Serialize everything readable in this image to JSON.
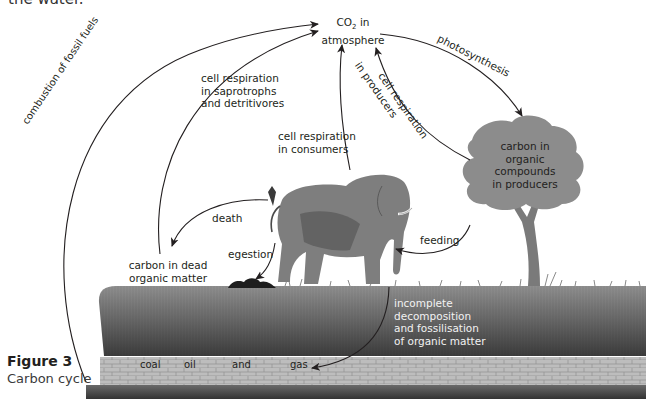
{
  "header": {
    "clipped_text": "the water."
  },
  "caption": {
    "figure": "Figure 3",
    "title": "Carbon cycle"
  },
  "nodes": {
    "atmosphere": {
      "line1": "CO",
      "sub": "2",
      "line1b": " in",
      "line2": "atmosphere"
    },
    "producers": [
      "carbon in",
      "organic",
      "compounds",
      "in producers"
    ],
    "dead_matter": [
      "carbon in dead",
      "organic matter"
    ]
  },
  "processes": {
    "combustion": "combustion of fossil fuels",
    "resp_saprotrophs": [
      "cell respiration",
      "in saprotrophs",
      "and detritivores"
    ],
    "resp_consumers": [
      "cell respiration",
      "in consumers"
    ],
    "resp_producers": [
      "cell respiration",
      "in producers"
    ],
    "photosynthesis": "photosynthesis",
    "death": "death",
    "egestion": "egestion",
    "feeding": "feeding",
    "fossilisation": [
      "incomplete",
      "decomposition",
      "and fossilisation",
      "of organic matter"
    ]
  },
  "fossil_fuels": [
    "coal",
    "oil",
    "and",
    "gas"
  ],
  "colors": {
    "ink": "#231f20",
    "soil_top": "#8a8a8a",
    "soil_bottom": "#3a3a3a",
    "brick": "#b8b8b8",
    "foliage": "#8c8c8c",
    "elephant": "#7d7d7d"
  }
}
